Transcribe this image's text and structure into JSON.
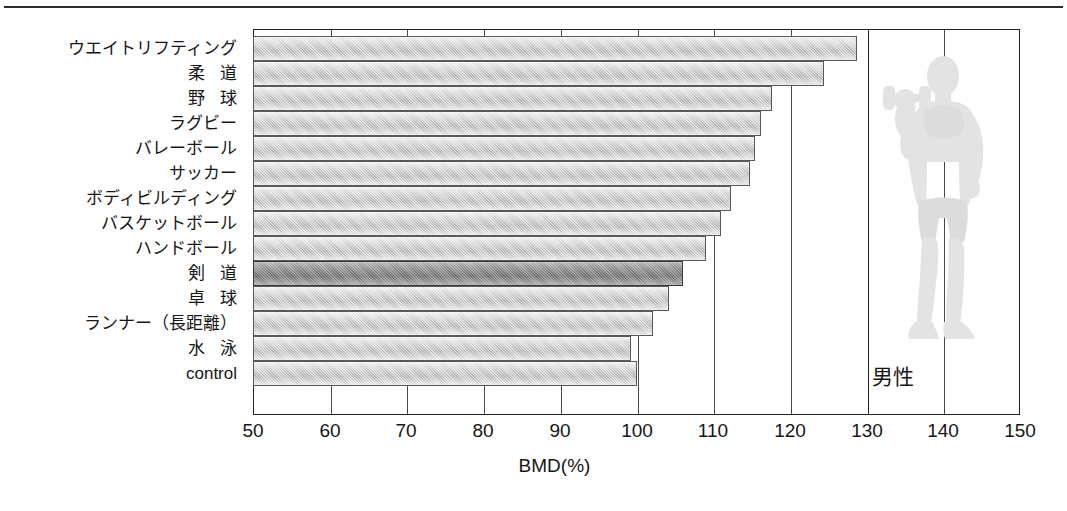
{
  "figure": {
    "sex_label": "男性",
    "silhouette_icon": "bodybuilder-with-dumbbell-icon",
    "silhouette_color": "#e2e2e2"
  },
  "chart_data": {
    "type": "bar",
    "orientation": "horizontal",
    "title": "",
    "xlabel": "BMD(%)",
    "ylabel": "",
    "xlim": [
      50,
      150
    ],
    "xticks": [
      50,
      60,
      70,
      80,
      90,
      100,
      110,
      120,
      130,
      140,
      150
    ],
    "xtick_labels": [
      "50",
      "60",
      "70",
      "80",
      "90",
      "100",
      "110",
      "120",
      "130",
      "140",
      "150"
    ],
    "grid": true,
    "legend": false,
    "categories": [
      "ウエイトリフティング",
      "柔 道",
      "野 球",
      "ラグビー",
      "バレーボール",
      "サッカー",
      "ボディビルディング",
      "バスケットボール",
      "ハンドボール",
      "剣 道",
      "卓 球",
      "ランナー（長距離）",
      "水 泳",
      "control"
    ],
    "values": [
      128.7,
      124.5,
      117.7,
      116.2,
      115.4,
      114.8,
      112.3,
      111.0,
      109.1,
      106.0,
      104.2,
      102.2,
      99.3,
      100.0
    ],
    "highlighted_index": 9,
    "bar_colors": {
      "default": "#c3c3c3",
      "highlight": "#7f7f7f",
      "border": "#595959"
    }
  }
}
